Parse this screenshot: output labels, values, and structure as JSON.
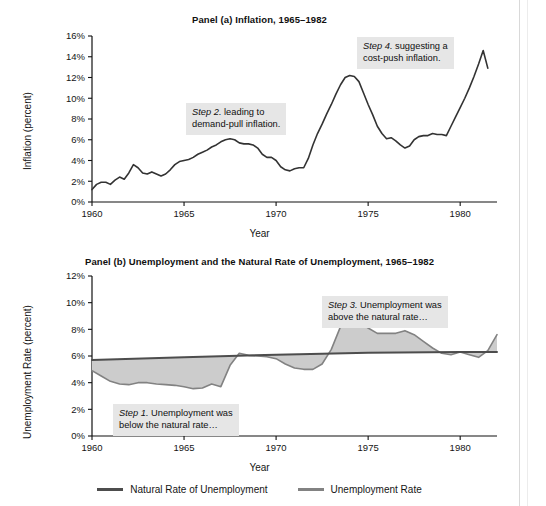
{
  "figure": {
    "xlabel": "Year",
    "legend": [
      {
        "label": "Natural Rate of Unemployment",
        "color": "#4d4d4d",
        "swatch": "natural"
      },
      {
        "label": "Unemployment Rate",
        "color": "#828282",
        "swatch": "unemp"
      }
    ]
  },
  "panel_a": {
    "title": "Panel (a) Inflation, 1965–1982",
    "ylabel": "Inflation (percent)",
    "xlabel": "Year",
    "ytick_labels": [
      "0%",
      "2%",
      "4%",
      "6%",
      "8%",
      "10%",
      "12%",
      "14%",
      "16%"
    ],
    "xtick_labels": [
      "1960",
      "1965",
      "1970",
      "1975",
      "1980"
    ],
    "callout_2": {
      "step": "Step 2.",
      "text_line1": " leading to",
      "text_line2": "demand-pull inflation."
    },
    "callout_4": {
      "step": "Step 4.",
      "text_line1": " suggesting a",
      "text_line2": "cost-push inflation."
    }
  },
  "panel_b": {
    "title": "Panel (b) Unemployment and the Natural Rate of Unemployment, 1965–1982",
    "ylabel": "Unemployment Rate (percent)",
    "xlabel": "Year",
    "ytick_labels": [
      "0%",
      "2%",
      "4%",
      "6%",
      "8%",
      "10%",
      "12%"
    ],
    "xtick_labels": [
      "1960",
      "1965",
      "1970",
      "1975",
      "1980"
    ],
    "callout_1": {
      "step": "Step 1.",
      "text_line1": " Unemployment was",
      "text_line2": "below the natural rate…"
    },
    "callout_3": {
      "step": "Step 3.",
      "text_line1": " Unemployment was",
      "text_line2": "above the natural rate…"
    }
  },
  "chart_data": [
    {
      "type": "line",
      "panel": "a",
      "title": "Panel (a) Inflation, 1965–1982",
      "xlabel": "Year",
      "ylabel": "Inflation (percent)",
      "xlim": [
        1960,
        1982
      ],
      "ylim": [
        0,
        16
      ],
      "yticks": [
        0,
        2,
        4,
        6,
        8,
        10,
        12,
        14,
        16
      ],
      "ytick_labels": [
        "0%",
        "2%",
        "4%",
        "6%",
        "8%",
        "10%",
        "12%",
        "14%",
        "16%"
      ],
      "xticks": [
        1960,
        1965,
        1970,
        1975,
        1980
      ],
      "grid": false,
      "legend_position": "none",
      "line_color": "#333333",
      "series": [
        {
          "name": "Inflation Rate",
          "x": [
            1960.0,
            1960.25,
            1960.5,
            1960.75,
            1961.0,
            1961.25,
            1961.5,
            1961.75,
            1962.0,
            1962.25,
            1962.5,
            1962.75,
            1963.0,
            1963.25,
            1963.5,
            1963.75,
            1964.0,
            1964.25,
            1964.5,
            1964.75,
            1965.0,
            1965.25,
            1965.5,
            1965.75,
            1966.0,
            1966.25,
            1966.5,
            1966.75,
            1967.0,
            1967.25,
            1967.5,
            1967.75,
            1968.0,
            1968.25,
            1968.5,
            1968.75,
            1969.0,
            1969.25,
            1969.5,
            1969.75,
            1970.0,
            1970.25,
            1970.5,
            1970.75,
            1971.0,
            1971.25,
            1971.5,
            1971.75,
            1972.0,
            1972.25,
            1972.5,
            1972.75,
            1973.0,
            1973.25,
            1973.5,
            1973.75,
            1974.0,
            1974.25,
            1974.5,
            1974.75,
            1975.0,
            1975.25,
            1975.5,
            1975.75,
            1976.0,
            1976.25,
            1976.5,
            1976.75,
            1977.0,
            1977.25,
            1977.5,
            1977.75,
            1978.0,
            1978.25,
            1978.5,
            1978.75,
            1979.0,
            1979.25,
            1979.5,
            1979.75,
            1980.0,
            1980.25,
            1980.5,
            1980.75,
            1981.0,
            1981.25,
            1981.5
          ],
          "y": [
            1.2,
            1.7,
            1.9,
            1.9,
            1.7,
            2.1,
            2.4,
            2.2,
            2.8,
            3.6,
            3.3,
            2.8,
            2.7,
            2.9,
            2.7,
            2.5,
            2.7,
            3.1,
            3.6,
            3.9,
            4.0,
            4.1,
            4.3,
            4.6,
            4.8,
            5.0,
            5.3,
            5.5,
            5.8,
            6.0,
            6.1,
            6.0,
            5.7,
            5.6,
            5.6,
            5.5,
            5.2,
            4.6,
            4.3,
            4.3,
            4.0,
            3.4,
            3.1,
            3.0,
            3.2,
            3.3,
            3.3,
            4.2,
            5.5,
            6.6,
            7.5,
            8.5,
            9.4,
            10.4,
            11.3,
            12.0,
            12.2,
            12.1,
            11.6,
            10.5,
            9.4,
            8.4,
            7.3,
            6.6,
            6.1,
            6.2,
            5.9,
            5.5,
            5.2,
            5.4,
            6.0,
            6.3,
            6.4,
            6.4,
            6.6,
            6.5,
            6.5,
            6.4,
            7.3,
            8.2,
            9.1,
            10.0,
            11.0,
            12.1,
            13.3,
            14.6,
            12.9
          ],
          "units": "percent"
        }
      ],
      "annotations": [
        {
          "id": "step2",
          "text": "Step 2. leading to demand-pull inflation.",
          "x": 1965.3,
          "y": 8.6
        },
        {
          "id": "step4",
          "text": "Step 4. suggesting a cost-push inflation.",
          "x": 1975.2,
          "y": 15.4
        }
      ]
    },
    {
      "type": "line",
      "panel": "b",
      "title": "Panel (b) Unemployment and the Natural Rate of Unemployment, 1965–1982",
      "xlabel": "Year",
      "ylabel": "Unemployment Rate (percent)",
      "xlim": [
        1960,
        1982
      ],
      "ylim": [
        0,
        12
      ],
      "yticks": [
        0,
        2,
        4,
        6,
        8,
        10,
        12
      ],
      "ytick_labels": [
        "0%",
        "2%",
        "4%",
        "6%",
        "8%",
        "10%",
        "12%"
      ],
      "xticks": [
        1960,
        1965,
        1970,
        1975,
        1980
      ],
      "grid": false,
      "legend_position": "bottom",
      "fill_between": {
        "series_a": "Unemployment Rate",
        "series_b": "Natural Rate of Unemployment",
        "color": "#cccccc"
      },
      "series": [
        {
          "name": "Unemployment Rate",
          "color": "#828282",
          "x": [
            1960.0,
            1960.5,
            1961.0,
            1961.5,
            1962.0,
            1962.5,
            1963.0,
            1963.5,
            1964.0,
            1964.5,
            1965.0,
            1965.5,
            1966.0,
            1966.5,
            1967.0,
            1967.5,
            1968.0,
            1968.5,
            1969.0,
            1969.5,
            1970.0,
            1970.5,
            1971.0,
            1971.5,
            1972.0,
            1972.5,
            1973.0,
            1973.5,
            1974.0,
            1974.5,
            1975.0,
            1975.5,
            1976.0,
            1976.5,
            1977.0,
            1977.5,
            1978.0,
            1978.5,
            1979.0,
            1979.5,
            1980.0,
            1980.5,
            1981.0,
            1981.5,
            1982.0
          ],
          "y": [
            4.9,
            4.5,
            4.1,
            3.9,
            3.85,
            4.0,
            4.0,
            3.9,
            3.85,
            3.8,
            3.7,
            3.55,
            3.6,
            3.9,
            3.7,
            5.3,
            6.2,
            6.05,
            6.0,
            5.95,
            5.8,
            5.4,
            5.1,
            5.0,
            5.0,
            5.4,
            6.5,
            8.2,
            8.85,
            8.6,
            8.1,
            7.7,
            7.7,
            7.7,
            7.9,
            7.6,
            7.1,
            6.6,
            6.2,
            6.1,
            6.3,
            6.1,
            5.9,
            6.4,
            7.6
          ],
          "units": "percent"
        },
        {
          "name": "Natural Rate of Unemployment",
          "color": "#4d4d4d",
          "x": [
            1960,
            1965,
            1970,
            1975,
            1980,
            1982
          ],
          "y": [
            5.7,
            5.9,
            6.1,
            6.25,
            6.3,
            6.3
          ],
          "units": "percent"
        }
      ],
      "annotations": [
        {
          "id": "step1",
          "text": "Step 1. Unemployment was below the natural rate…",
          "x": 1961.6,
          "y": 2.5
        },
        {
          "id": "step3",
          "text": "Step 3. Unemployment was above the natural rate…",
          "x": 1973.0,
          "y": 10.8
        }
      ]
    }
  ]
}
